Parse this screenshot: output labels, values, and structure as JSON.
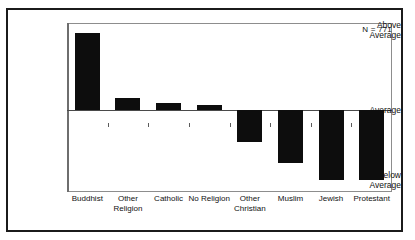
{
  "figure": {
    "title_remnant": "",
    "annotation": "N = 771",
    "annotation_name": "sample-size-annotation"
  },
  "chart_data": {
    "type": "bar",
    "title": "",
    "subtitle": "",
    "xlabel": "",
    "ylabel": "",
    "categories": [
      "Buddhist",
      "Other\nReligion",
      "Catholic",
      "No Religion",
      "Other\nChristian",
      "Muslim",
      "Jewish",
      "Protestant"
    ],
    "values": [
      77,
      12,
      7,
      5,
      -32,
      -53,
      -70,
      -70
    ],
    "value_units": "pixels-from-average-baseline",
    "ytick_labels": [
      "Above\nAverage",
      "Average",
      "Below\nAverage"
    ],
    "ytick_values": [
      77,
      0,
      -70
    ],
    "ylim": [
      -82,
      87
    ],
    "grid": false,
    "legend": null,
    "legend_position": "none",
    "annotations": [
      "N = 771"
    ],
    "bar_color": "#0d0d0d",
    "baseline_color": "#4a4a4a",
    "axis_color": "#8d8d8d",
    "background_color": "#ffffff",
    "frame_color": "#1b1b1b"
  },
  "axes": {
    "y_top_label": "Above\nAverage",
    "y_mid_label": "Average",
    "y_bottom_label": "Below\nAverage"
  }
}
